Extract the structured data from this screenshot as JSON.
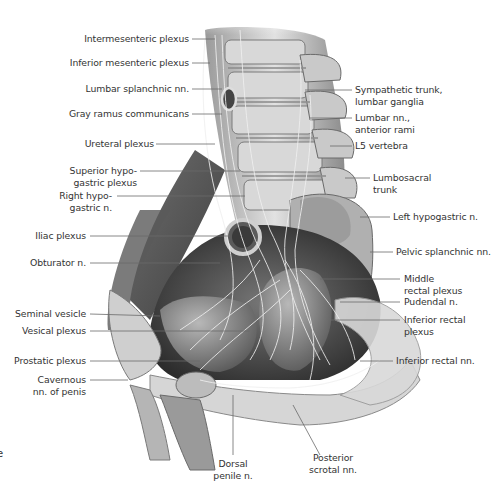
{
  "figure": {
    "type": "anatomical-illustration",
    "edge_glyph": "e",
    "labels_left": [
      {
        "id": "intermesenteric-plexus",
        "lines": [
          "Intermesenteric plexus"
        ]
      },
      {
        "id": "inferior-mesenteric-plexus",
        "lines": [
          "Inferior mesenteric plexus"
        ]
      },
      {
        "id": "lumbar-splanchnic-nn",
        "lines": [
          "Lumbar splanchnic nn."
        ]
      },
      {
        "id": "gray-ramus-communicans",
        "lines": [
          "Gray ramus communicans"
        ]
      },
      {
        "id": "ureteral-plexus",
        "lines": [
          "Ureteral plexus"
        ]
      },
      {
        "id": "superior-hypogastric-plexus",
        "lines": [
          "Superior hypo-",
          "gastric plexus"
        ]
      },
      {
        "id": "right-hypogastric-n",
        "lines": [
          "Right hypo-",
          "gastric n."
        ]
      },
      {
        "id": "iliac-plexus",
        "lines": [
          "Iliac plexus"
        ]
      },
      {
        "id": "obturator-n",
        "lines": [
          "Obturator n."
        ]
      },
      {
        "id": "seminal-vesicle",
        "lines": [
          "Seminal vesicle"
        ]
      },
      {
        "id": "vesical-plexus",
        "lines": [
          "Vesical plexus"
        ]
      },
      {
        "id": "prostatic-plexus",
        "lines": [
          "Prostatic plexus"
        ]
      },
      {
        "id": "cavernous-nn-of-penis",
        "lines": [
          "Cavernous",
          "nn. of penis"
        ]
      }
    ],
    "labels_right": [
      {
        "id": "sympathetic-trunk-lumbar-ganglia",
        "lines": [
          "Sympathetic trunk,",
          "lumbar ganglia"
        ]
      },
      {
        "id": "lumbar-nn-anterior-rami",
        "lines": [
          "Lumbar nn.,",
          "anterior rami"
        ]
      },
      {
        "id": "l5-vertebra",
        "lines": [
          "L5 vertebra"
        ]
      },
      {
        "id": "lumbosacral-trunk",
        "lines": [
          "Lumbosacral",
          "trunk"
        ]
      },
      {
        "id": "left-hypogastric-n",
        "lines": [
          "Left hypogastric n."
        ]
      },
      {
        "id": "pelvic-splanchnic-nn",
        "lines": [
          "Pelvic splanchnic nn."
        ]
      },
      {
        "id": "middle-rectal-plexus",
        "lines": [
          "Middle",
          "rectal plexus"
        ]
      },
      {
        "id": "pudendal-n",
        "lines": [
          "Pudendal n."
        ]
      },
      {
        "id": "inferior-rectal-plexus",
        "lines": [
          "Inferior rectal",
          "plexus"
        ]
      },
      {
        "id": "inferior-rectal-nn",
        "lines": [
          "Inferior rectal nn."
        ]
      }
    ],
    "labels_bottom": [
      {
        "id": "dorsal-penile-n",
        "lines": [
          "Dorsal",
          "penile n."
        ]
      },
      {
        "id": "posterior-scrotal-nn",
        "lines": [
          "Posterior",
          "scrotal nn."
        ]
      }
    ],
    "colors": {
      "background": "#ffffff",
      "label_text": "#333333",
      "leader_line": "#6a6a6a",
      "tissue_dark": "#3a3a3a",
      "tissue_mid": "#8a8a8a",
      "tissue_light": "#d6d6d6"
    }
  }
}
